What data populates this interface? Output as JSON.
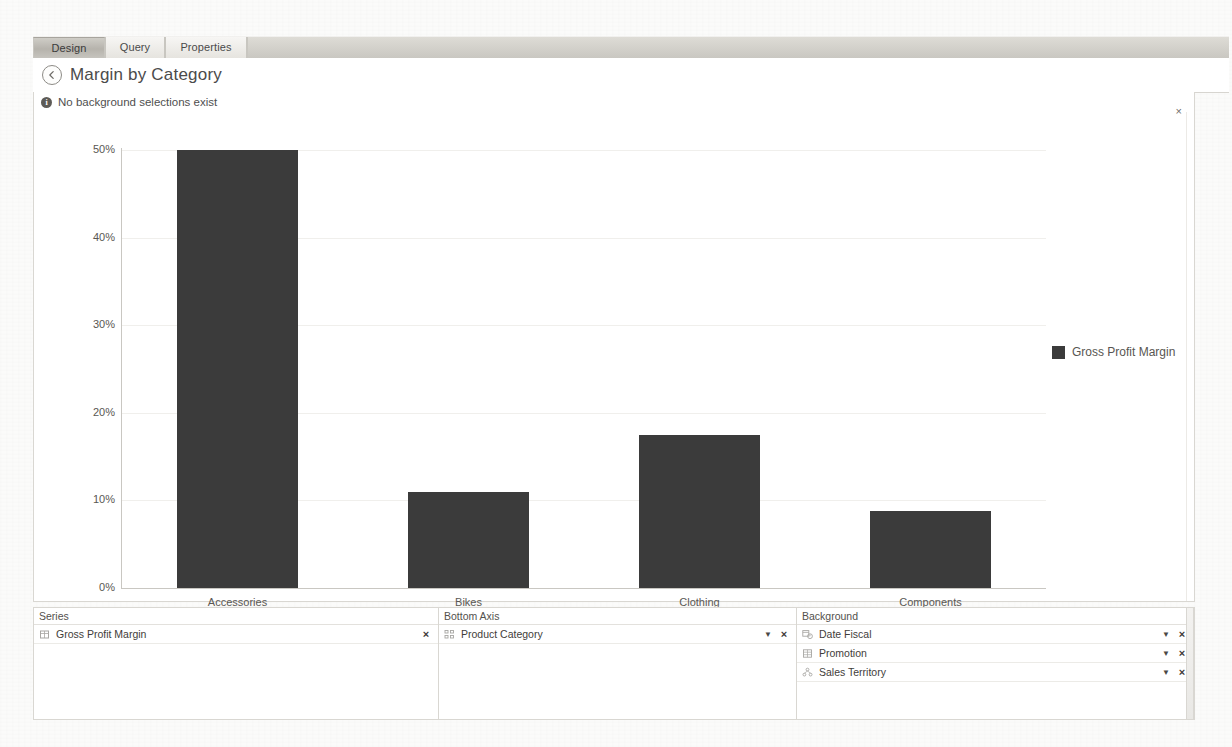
{
  "window": {
    "tabs": [
      {
        "label": "Design",
        "active": true
      },
      {
        "label": "Query",
        "active": false
      },
      {
        "label": "Properties",
        "active": false
      }
    ]
  },
  "header": {
    "back_icon": "back-arrow-icon",
    "title": "Margin by Category"
  },
  "notice": {
    "icon": "info-icon",
    "glyph": "i",
    "text": "No background selections exist",
    "close_glyph": "×"
  },
  "chart_data": {
    "type": "bar",
    "title": "Margin by Category",
    "categories": [
      "Accessories",
      "Bikes",
      "Clothing",
      "Components"
    ],
    "series": [
      {
        "name": "Gross Profit Margin",
        "values": [
          50,
          11,
          17.5,
          8.8
        ],
        "color": "#3b3b3b"
      }
    ],
    "values": [
      50,
      11,
      17.5,
      8.8
    ],
    "ytick_labels": [
      "50%",
      "40%",
      "30%",
      "20%",
      "10%",
      "0%"
    ],
    "ytick_values": [
      50,
      40,
      30,
      20,
      10,
      0
    ],
    "ylim": [
      0,
      50
    ],
    "xlabel": "",
    "ylabel": "",
    "grid": true,
    "legend": {
      "position": "right",
      "entries": [
        "Gross Profit Margin"
      ]
    }
  },
  "panels": [
    {
      "id": "series",
      "header": "Series",
      "fields": [
        {
          "label": "Gross Profit Margin",
          "icon": "measure-icon",
          "has_caret": false,
          "remove_glyph": "×"
        }
      ]
    },
    {
      "id": "bottom-axis",
      "header": "Bottom Axis",
      "fields": [
        {
          "label": "Product Category",
          "icon": "hierarchy-icon",
          "has_caret": true,
          "caret_glyph": "▼",
          "remove_glyph": "×"
        }
      ]
    },
    {
      "id": "background",
      "header": "Background",
      "fields": [
        {
          "label": "Date Fiscal",
          "icon": "calendar-icon",
          "has_caret": true,
          "caret_glyph": "▼",
          "remove_glyph": "×"
        },
        {
          "label": "Promotion",
          "icon": "table-icon",
          "has_caret": true,
          "caret_glyph": "▼",
          "remove_glyph": "×"
        },
        {
          "label": "Sales Territory",
          "icon": "territory-icon",
          "has_caret": true,
          "caret_glyph": "▼",
          "remove_glyph": "×"
        }
      ]
    }
  ]
}
